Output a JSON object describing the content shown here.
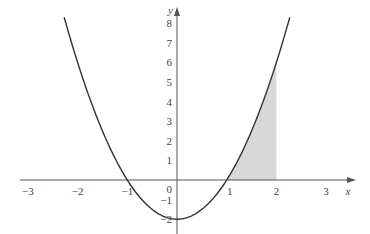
{
  "chart_data": {
    "type": "line",
    "title": "",
    "function": "y = 2x^2 - 2",
    "series": [
      {
        "name": "f(x) = 2x^2 - 2",
        "x": [
          -2.27,
          -2,
          -1.5,
          -1,
          -0.5,
          0,
          0.5,
          1,
          1.5,
          2,
          2.27
        ],
        "values": [
          8.3,
          6,
          2.5,
          0,
          -1.5,
          -2,
          -1.5,
          0,
          2.5,
          6,
          8.3
        ]
      }
    ],
    "shaded_region": {
      "x_from": 1,
      "x_to": 2,
      "between": "curve and x-axis",
      "color": "#d8d8d8"
    },
    "xlabel": "x",
    "ylabel": "y",
    "x_ticks": [
      "-3",
      "-2",
      "-1",
      "0",
      "1",
      "2",
      "3"
    ],
    "y_ticks": [
      "-2",
      "-1",
      "0",
      "1",
      "2",
      "3",
      "4",
      "5",
      "6",
      "7",
      "8"
    ],
    "xlim": [
      -3.2,
      3.6
    ],
    "ylim": [
      -2.5,
      9
    ],
    "grid": false,
    "legend": null,
    "colors": {
      "curve": "#333333",
      "axes": "#555555",
      "shade": "#d8d8d8"
    }
  }
}
